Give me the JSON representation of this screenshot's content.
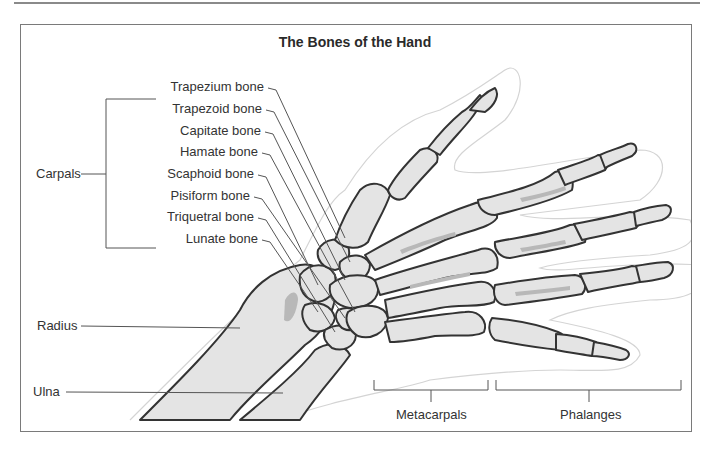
{
  "title": "The Bones of the Hand",
  "groups": {
    "carpals": "Carpals",
    "metacarpals": "Metacarpals",
    "phalanges": "Phalanges"
  },
  "carpal_bones": [
    "Trapezium bone",
    "Trapezoid bone",
    "Capitate bone",
    "Hamate bone",
    "Scaphoid bone",
    "Pisiform bone",
    "Triquetral bone",
    "Lunate bone"
  ],
  "forearm_bones": {
    "radius": "Radius",
    "ulna": "Ulna"
  },
  "colors": {
    "bone_fill": "#e4e4e4",
    "bone_shade": "#b8b8b8",
    "bone_outline": "#333333",
    "leader_line": "#555555",
    "skin_outline": "#d0d0d0",
    "frame": "#7a7a7a"
  }
}
